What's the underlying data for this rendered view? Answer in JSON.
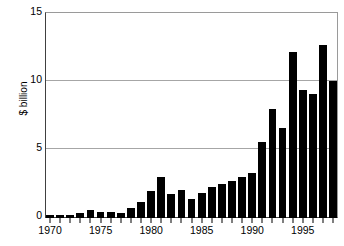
{
  "chart_data": {
    "type": "bar",
    "title": "",
    "xlabel": "",
    "ylabel": "$ billion",
    "ylim": [
      0,
      15
    ],
    "yticks": [
      0,
      5,
      10,
      15
    ],
    "ytick_labels": [
      "0",
      "5",
      "10",
      "15"
    ],
    "grid": true,
    "legend": "none",
    "bar_color": "#000000",
    "categories": [
      "1970",
      "1971",
      "1972",
      "1973",
      "1974",
      "1975",
      "1976",
      "1977",
      "1978",
      "1979",
      "1980",
      "1981",
      "1982",
      "1983",
      "1984",
      "1985",
      "1986",
      "1987",
      "1988",
      "1989",
      "1990",
      "1991",
      "1992",
      "1993",
      "1994",
      "1995",
      "1996",
      "1997",
      "1998"
    ],
    "values": [
      0.25,
      0.25,
      0.25,
      0.4,
      0.6,
      0.45,
      0.45,
      0.4,
      0.7,
      1.15,
      1.95,
      3.0,
      1.75,
      2.05,
      1.4,
      1.85,
      2.25,
      2.5,
      2.75,
      3.05,
      3.3,
      5.6,
      8.0,
      6.6,
      12.2,
      9.4,
      9.15,
      12.7,
      10.1
    ],
    "tick_label_years": [
      "1970",
      "1975",
      "1980",
      "1985",
      "1990",
      "1995"
    ]
  },
  "axes": {
    "y_title": "$ billion"
  }
}
